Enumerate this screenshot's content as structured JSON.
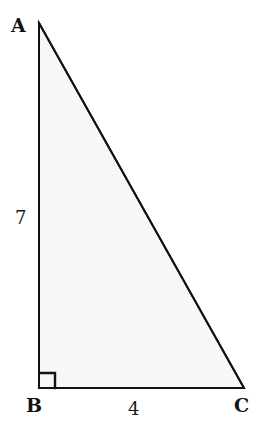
{
  "figure": {
    "type": "geometry-diagram",
    "background_color": "#ffffff",
    "stroke_color": "#121212",
    "fill_color": "#f7f7f7",
    "stroke_width": 2,
    "vertices": [
      {
        "name": "A",
        "label": "A",
        "x": 39,
        "y": 23,
        "label_x": 11,
        "label_y": 16
      },
      {
        "name": "B",
        "label": "B",
        "x": 39,
        "y": 388,
        "label_x": 26,
        "label_y": 396
      },
      {
        "name": "C",
        "label": "C",
        "x": 244,
        "y": 388,
        "label_x": 234,
        "label_y": 396
      }
    ],
    "sides": [
      {
        "name": "AB",
        "role": "vertical-leg",
        "label": "7",
        "label_x": 15,
        "label_y": 209
      },
      {
        "name": "BC",
        "role": "horizontal-leg",
        "label": "4",
        "label_x": 128,
        "label_y": 400
      },
      {
        "name": "AC",
        "role": "hypotenuse",
        "label": "",
        "label_x": 0,
        "label_y": 0
      }
    ],
    "right_angle": {
      "at_vertex": "B",
      "marker": "square",
      "size": 15
    }
  }
}
